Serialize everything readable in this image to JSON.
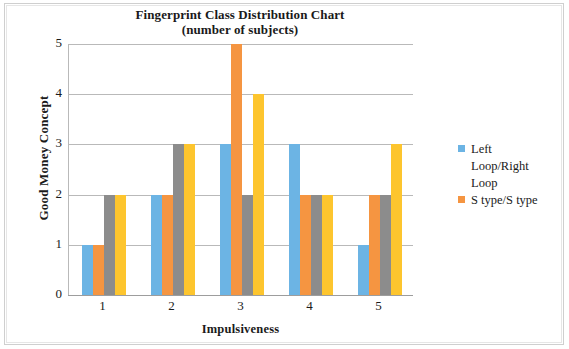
{
  "chart_data": {
    "type": "bar",
    "title": "Fingerprint Class Distribution Chart",
    "subtitle": "(number of subjects)",
    "xlabel": "Impulsiveness",
    "ylabel": "Good Money Concept",
    "categories": [
      "1",
      "2",
      "3",
      "4",
      "5"
    ],
    "yticks": [
      "5",
      "4",
      "3",
      "2",
      "1",
      "0"
    ],
    "ylim": [
      0,
      5
    ],
    "grid": true,
    "legend_position": "right",
    "series": [
      {
        "name": "Left Loop/Right Loop",
        "color": "#6cb4e4",
        "values": [
          1,
          2,
          3,
          3,
          1
        ]
      },
      {
        "name": "S type/S type",
        "color": "#f59541",
        "values": [
          1,
          2,
          5,
          2,
          2
        ]
      },
      {
        "name": "",
        "color": "#8c8c8c",
        "values": [
          2,
          3,
          2,
          2,
          2
        ]
      },
      {
        "name": "",
        "color": "#fdc52e",
        "values": [
          2,
          3,
          4,
          2,
          3
        ]
      }
    ],
    "legend_entries": [
      {
        "label_line1": "Left",
        "label_line2": "Loop/Right",
        "label_line3": "Loop",
        "color": "#6cb4e4"
      },
      {
        "label_line1": "S type/S type",
        "color": "#f59541"
      }
    ]
  }
}
